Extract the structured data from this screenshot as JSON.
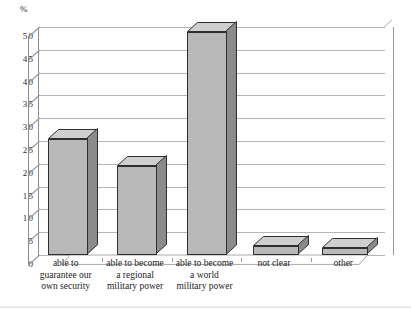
{
  "chart_data": {
    "type": "bar",
    "title": "",
    "subtitle": "",
    "xlabel": "",
    "ylabel": "%",
    "unit_label": "%",
    "ylim": [
      0,
      50
    ],
    "ytick_step": 5,
    "grid": true,
    "legend": "none",
    "style": "3d-column",
    "categories": [
      "able to\nguarantee our\nown security",
      "able to become\na regional\nmilitary power",
      "able to become\na world\nmilitary power",
      "not clear",
      "other"
    ],
    "category_lines": [
      [
        "able to",
        "guarantee our",
        "own security"
      ],
      [
        "able to become",
        "a regional",
        "military power"
      ],
      [
        "able to become",
        "a world",
        "military power"
      ],
      [
        "not clear"
      ],
      [
        "other"
      ]
    ],
    "values": [
      25.5,
      19.5,
      49,
      2,
      1.5
    ],
    "yticks": [
      0,
      5,
      10,
      15,
      20,
      25,
      30,
      35,
      40,
      45,
      50
    ],
    "ytick_labels": [
      "0",
      "5",
      "10",
      "15",
      "20",
      "25",
      "30",
      "35",
      "40",
      "45",
      "50"
    ],
    "colors": {
      "bar_front": "#b9b9b9",
      "bar_top": "#cfcfcf",
      "bar_side": "#8b8b8b",
      "bar_outline": "#2e2e2e",
      "gridline": "#b5b5b5",
      "axis": "#8c8c8c",
      "text": "#1d1d1d",
      "background": "#ffffff"
    }
  }
}
